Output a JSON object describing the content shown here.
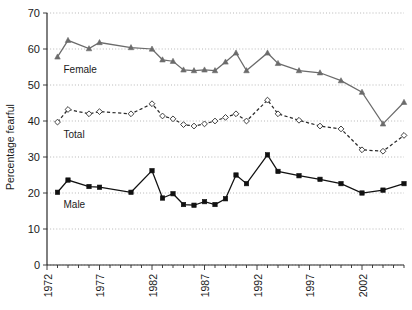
{
  "chart_data": {
    "type": "line",
    "title": "",
    "xlabel": "",
    "ylabel": "Percentage fearful",
    "xlim": [
      1972,
      2006
    ],
    "ylim": [
      0,
      70
    ],
    "grid": true,
    "legend_position": "inline-labels",
    "y_ticks": [
      0,
      10,
      20,
      30,
      40,
      50,
      60,
      70
    ],
    "y_tick_labels": [
      "0",
      "10",
      "20",
      "30",
      "40",
      "50",
      "60",
      "70"
    ],
    "x_ticks": [
      1972,
      1977,
      1982,
      1987,
      1992,
      1997,
      2002
    ],
    "x_tick_labels": [
      "1972",
      "1977",
      "1982",
      "1987",
      "1992",
      "1997",
      "2002"
    ],
    "x_minor_ticks": [
      1972,
      1973,
      1974,
      1975,
      1976,
      1977,
      1978,
      1979,
      1980,
      1981,
      1982,
      1983,
      1984,
      1985,
      1986,
      1987,
      1988,
      1989,
      1990,
      1991,
      1992,
      1993,
      1994,
      1995,
      1996,
      1997,
      1998,
      1999,
      2000,
      2001,
      2002,
      2003,
      2004,
      2005,
      2006
    ],
    "series": [
      {
        "name": "Female",
        "label": "Female",
        "color": "#6b6b6b",
        "marker": "triangle",
        "line_style": "solid",
        "x": [
          1973,
          1974,
          1976,
          1977,
          1980,
          1982,
          1983,
          1984,
          1985,
          1986,
          1987,
          1988,
          1989,
          1990,
          1991,
          1993,
          1994,
          1996,
          1998,
          2000,
          2002,
          2004,
          2006
        ],
        "values": [
          57.8,
          62.4,
          60.1,
          61.8,
          60.4,
          60.0,
          57.0,
          56.6,
          54.2,
          54.0,
          54.2,
          54.0,
          56.4,
          58.9,
          54.0,
          58.9,
          56.0,
          54.0,
          53.4,
          51.2,
          48.0,
          39.2,
          45.2
        ]
      },
      {
        "name": "Total",
        "label": "Total",
        "color": "#2b2b2b",
        "marker": "open-diamond",
        "line_style": "dashed",
        "x": [
          1973,
          1974,
          1976,
          1977,
          1980,
          1982,
          1983,
          1984,
          1985,
          1986,
          1987,
          1988,
          1989,
          1990,
          1991,
          1993,
          1994,
          1996,
          1998,
          2000,
          2002,
          2004,
          2006
        ],
        "values": [
          39.7,
          43.2,
          42.0,
          42.6,
          42.0,
          44.8,
          41.4,
          40.6,
          39.0,
          38.6,
          39.2,
          40.0,
          41.0,
          42.0,
          40.0,
          45.8,
          42.0,
          40.2,
          38.6,
          37.8,
          32.0,
          31.6,
          36.0
        ]
      },
      {
        "name": "Male",
        "label": "Male",
        "color": "#111111",
        "marker": "square",
        "line_style": "solid",
        "x": [
          1973,
          1974,
          1976,
          1977,
          1980,
          1982,
          1983,
          1984,
          1985,
          1986,
          1987,
          1988,
          1989,
          1990,
          1991,
          1993,
          1994,
          1996,
          1998,
          2000,
          2002,
          2004,
          2006
        ],
        "values": [
          20.2,
          23.6,
          21.8,
          21.6,
          20.2,
          26.2,
          18.6,
          19.8,
          16.8,
          16.6,
          17.6,
          16.8,
          18.4,
          25.0,
          22.6,
          30.6,
          26.0,
          24.8,
          23.8,
          22.6,
          20.0,
          20.8,
          22.6
        ]
      }
    ]
  }
}
